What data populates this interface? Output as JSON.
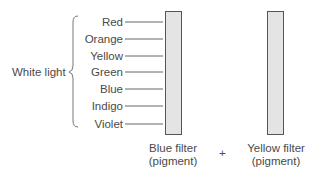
{
  "diagram": {
    "source_label": "White light",
    "spectrum": [
      "Red",
      "Orange",
      "Yellow",
      "Green",
      "Blue",
      "Indigo",
      "Violet"
    ],
    "filters": [
      {
        "line1": "Blue filter",
        "line2": "(pigment)"
      },
      {
        "line1": "Yellow filter",
        "line2": "(pigment)"
      }
    ],
    "operator": "+",
    "colors": {
      "filter_fill": "#e4e4e4",
      "stroke": "#555555",
      "text": "#4a4a4a"
    }
  }
}
